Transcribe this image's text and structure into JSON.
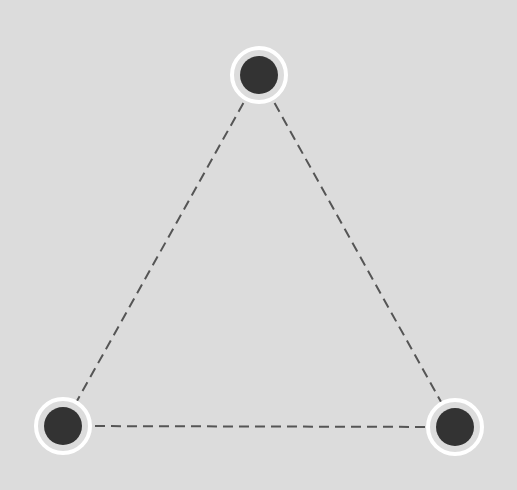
{
  "diagram": {
    "type": "triangle-graph",
    "background_color": "#dcdcdc",
    "edge_color": "#555555",
    "edge_style": "dashed",
    "node_fill_color": "#333333",
    "node_ring_color": "#ffffff",
    "nodes": [
      {
        "id": "top",
        "cx": 259,
        "cy": 75
      },
      {
        "id": "bottom-left",
        "cx": 63,
        "cy": 426
      },
      {
        "id": "bottom-right",
        "cx": 455,
        "cy": 427
      }
    ],
    "edges": [
      {
        "from": "top",
        "to": "bottom-left"
      },
      {
        "from": "top",
        "to": "bottom-right"
      },
      {
        "from": "bottom-left",
        "to": "bottom-right"
      }
    ]
  }
}
